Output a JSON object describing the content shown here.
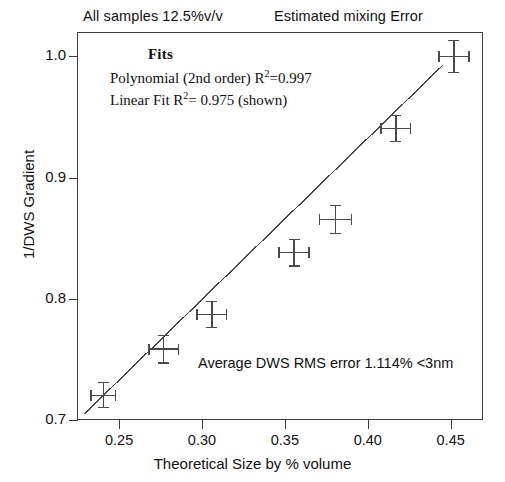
{
  "captions": {
    "left": "All samples 12.5%v/v",
    "right": "Estimated mixing Error"
  },
  "annotations": {
    "fits_title": "Fits",
    "poly_prefix": "Polynomial (2nd order) R",
    "poly_sup": "2",
    "poly_value": "=0.997",
    "linear_prefix": "Linear Fit   R",
    "linear_sup": "2",
    "linear_value": "= 0.975 (shown)",
    "rms_note": "Average DWS RMS error 1.114%  <3nm"
  },
  "chart_data": {
    "type": "scatter",
    "title": "",
    "xlabel": "Theoretical Size by % volume",
    "ylabel": "1/DWS Gradient",
    "xlim": [
      0.2246,
      0.4695
    ],
    "ylim": [
      0.7,
      1.0201
    ],
    "xticks": [
      0.25,
      0.3,
      0.35,
      0.4,
      0.45
    ],
    "xtick_labels": [
      "0.25",
      "0.30",
      "0.35",
      "0.40",
      "0.45"
    ],
    "yticks": [
      0.7,
      0.8,
      0.9,
      1.0
    ],
    "ytick_labels": [
      "0.7",
      "0.8",
      "0.9",
      "1.0"
    ],
    "grid": false,
    "legend": "none",
    "series": [
      {
        "name": "Measured samples",
        "marker": "errorbar-cross",
        "x": [
          0.2405,
          0.277,
          0.306,
          0.3555,
          0.3805,
          0.417,
          0.452
        ],
        "y": [
          0.7205,
          0.7585,
          0.787,
          0.838,
          0.8655,
          0.9405,
          1.0
        ],
        "xerr": [
          0.0075,
          0.009,
          0.009,
          0.009,
          0.0095,
          0.009,
          0.009
        ],
        "yerr": [
          0.0105,
          0.0115,
          0.0105,
          0.011,
          0.0115,
          0.011,
          0.013
        ]
      }
    ],
    "fit": {
      "name": "Linear Fit",
      "type": "line",
      "r_squared": 0.975,
      "x": [
        0.229,
        0.4455
      ],
      "y": [
        0.705,
        0.993
      ]
    },
    "other_fit": {
      "name": "Polynomial (2nd order)",
      "r_squared": 0.997,
      "shown": false
    }
  },
  "axis_colors": {
    "frame": "#3a3a3a",
    "data": "#4a4a4a",
    "fit": "#444444"
  }
}
